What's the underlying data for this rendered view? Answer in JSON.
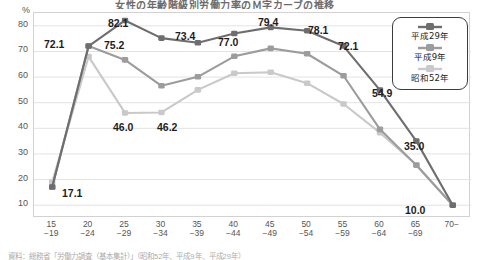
{
  "title": "女性の年齢階級別労働力率のＭ字カーブの推移",
  "footnote": "資料：総務省「労働力調査（基本集計）」（昭和52年、平成9年、平成29年）",
  "axis": {
    "unit": "%",
    "y_ticks": [
      80,
      70,
      60,
      50,
      40,
      30,
      20,
      10
    ],
    "ylim": [
      5,
      85
    ],
    "x_ticks": [
      {
        "top": "15",
        "bottom": "−19"
      },
      {
        "top": "20",
        "bottom": "−24"
      },
      {
        "top": "25",
        "bottom": "−29"
      },
      {
        "top": "30",
        "bottom": "−34"
      },
      {
        "top": "35",
        "bottom": "−39"
      },
      {
        "top": "40",
        "bottom": "−44"
      },
      {
        "top": "45",
        "bottom": "−49"
      },
      {
        "top": "50",
        "bottom": "−54"
      },
      {
        "top": "55",
        "bottom": "−59"
      },
      {
        "top": "60",
        "bottom": "−64"
      },
      {
        "top": "65",
        "bottom": "−69"
      },
      {
        "top": "70−",
        "bottom": ""
      }
    ]
  },
  "legend": {
    "items": [
      {
        "label": "平成29年",
        "color": "#6e6e6e"
      },
      {
        "label": "平成9年",
        "color": "#9c9c9c"
      },
      {
        "label": "昭和52年",
        "color": "#c9c9c9"
      }
    ]
  },
  "chart_data": {
    "type": "line",
    "title": "女性の年齢階級別労働力率のＭ字カーブの推移",
    "xlabel": "年齢階級",
    "ylabel": "%",
    "ylim": [
      5,
      85
    ],
    "grid": true,
    "legend_position": "top-right",
    "categories": [
      "15−19",
      "20−24",
      "25−29",
      "30−34",
      "35−39",
      "40−44",
      "45−49",
      "50−54",
      "55−59",
      "60−64",
      "65−69",
      "70−"
    ],
    "series": [
      {
        "name": "平成29年",
        "color": "#6e6e6e",
        "values": [
          17.1,
          72.1,
          82.1,
          75.2,
          73.4,
          77.0,
          79.4,
          78.1,
          72.1,
          54.9,
          35.0,
          10.0
        ]
      },
      {
        "name": "平成9年",
        "color": "#9c9c9c",
        "values": [
          17.1,
          72.1,
          66.7,
          56.6,
          60.1,
          68.1,
          71.2,
          69.1,
          60.5,
          39.6,
          25.6,
          10.0
        ]
      },
      {
        "name": "昭和52年",
        "color": "#c9c9c9",
        "values": [
          19.0,
          68.0,
          46.0,
          46.2,
          55.0,
          61.5,
          61.9,
          57.6,
          49.5,
          38.3,
          25.8,
          10.0
        ]
      }
    ],
    "annotations": [
      {
        "text": "17.1",
        "category": "15−19",
        "value": 17.1,
        "series": "平成29年"
      },
      {
        "text": "72.1",
        "category": "20−24",
        "value": 72.1,
        "series": "平成29年"
      },
      {
        "text": "82.1",
        "category": "25−29",
        "value": 82.1,
        "series": "平成29年"
      },
      {
        "text": "75.2",
        "category": "30−34",
        "value": 75.2,
        "series": "平成29年"
      },
      {
        "text": "73.4",
        "category": "35−39",
        "value": 73.4,
        "series": "平成29年"
      },
      {
        "text": "77.0",
        "category": "40−44",
        "value": 77.0,
        "series": "平成29年"
      },
      {
        "text": "79.4",
        "category": "45−49",
        "value": 79.4,
        "series": "平成29年"
      },
      {
        "text": "78.1",
        "category": "50−54",
        "value": 78.1,
        "series": "平成29年"
      },
      {
        "text": "72.1",
        "category": "55−59",
        "value": 72.1,
        "series": "平成29年"
      },
      {
        "text": "54.9",
        "category": "60−64",
        "value": 54.9,
        "series": "平成29年"
      },
      {
        "text": "35.0",
        "category": "65−69",
        "value": 35.0,
        "series": "平成29年"
      },
      {
        "text": "10.0",
        "category": "70−",
        "value": 10.0,
        "series": "平成29年"
      },
      {
        "text": "46.0",
        "category": "25−29",
        "value": 46.0,
        "series": "昭和52年"
      },
      {
        "text": "46.2",
        "category": "30−34",
        "value": 46.2,
        "series": "昭和52年"
      }
    ]
  },
  "value_labels": [
    {
      "text": "17.1",
      "left": 62,
      "top": 187
    },
    {
      "text": "72.1",
      "left": 44,
      "top": 38
    },
    {
      "text": "82.1",
      "left": 108,
      "top": 17
    },
    {
      "text": "75.2",
      "left": 104,
      "top": 39
    },
    {
      "text": "73.4",
      "left": 175,
      "top": 30
    },
    {
      "text": "77.0",
      "left": 218,
      "top": 36
    },
    {
      "text": "79.4",
      "left": 258,
      "top": 16
    },
    {
      "text": "78.1",
      "left": 308,
      "top": 24
    },
    {
      "text": "72.1",
      "left": 338,
      "top": 40
    },
    {
      "text": "54.9",
      "left": 372,
      "top": 87
    },
    {
      "text": "35.0",
      "left": 404,
      "top": 140
    },
    {
      "text": "46.0",
      "left": 113,
      "top": 121
    },
    {
      "text": "46.2",
      "left": 157,
      "top": 121
    },
    {
      "text": "10.0",
      "left": 405,
      "top": 204
    }
  ]
}
